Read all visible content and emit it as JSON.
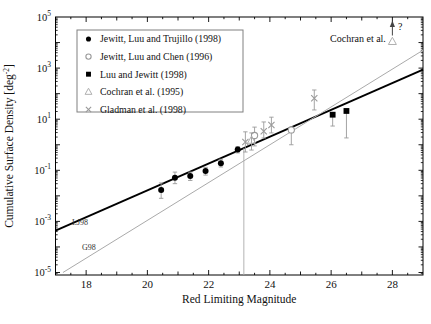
{
  "figure_title": "Cumulative surface density of Kuiper Belt objects versus red limiting magnitude",
  "colors": {
    "foreground": "#000000",
    "gray_marker": "#9a9a9a",
    "light_gray": "#b0b0b0",
    "g98_line": "#aaaaaa",
    "legend_border": "#808080",
    "background": "#ffffff"
  },
  "chart_data": {
    "type": "scatter",
    "xlabel": "Red Limiting Magnitude",
    "ylabel": "Cumulative Surface Density [deg⁻²]",
    "x_range": [
      17,
      29
    ],
    "y_exponent_range": [
      -5,
      5
    ],
    "axis_scale": {
      "x": "linear",
      "y": "log10"
    },
    "grid": false,
    "legend_position": "upper-left",
    "x_major_ticks": [
      18,
      20,
      22,
      24,
      26,
      28
    ],
    "y_labeled_exponents": [
      5,
      3,
      1,
      -1,
      -3,
      -5
    ],
    "series": [
      {
        "name": "Jewitt, Luu and Trujillo (1998)",
        "marker": "filled-circle",
        "color": "#000000",
        "points": [
          {
            "mag": 20.45,
            "density": 0.017,
            "err_lo": 0.008,
            "err_hi": 0.032
          },
          {
            "mag": 20.9,
            "density": 0.051,
            "err_lo": 0.03,
            "err_hi": 0.085
          },
          {
            "mag": 21.4,
            "density": 0.06,
            "err_lo": 0.04,
            "err_hi": 0.085
          },
          {
            "mag": 21.9,
            "density": 0.094,
            "err_lo": 0.065,
            "err_hi": 0.13
          },
          {
            "mag": 22.4,
            "density": 0.19,
            "err_lo": 0.135,
            "err_hi": 0.27
          },
          {
            "mag": 22.95,
            "density": 0.65,
            "err_lo": 0.48,
            "err_hi": 0.85
          }
        ]
      },
      {
        "name": "Jewitt, Luu and Chen (1996)",
        "marker": "open-circle",
        "color": "#9a9a9a",
        "points": [
          {
            "mag": 23.5,
            "density": 2.3,
            "err_lo": 0.9,
            "err_hi": 4.9
          },
          {
            "mag": 24.7,
            "density": 3.8,
            "err_lo": 1.0,
            "err_hi": 4.8
          }
        ]
      },
      {
        "name": "Luu and Jewitt (1998)",
        "marker": "filled-square",
        "color": "#000000",
        "points": [
          {
            "mag": 26.05,
            "density": 15,
            "err_lo": 5.4,
            "err_hi": 16.5
          },
          {
            "mag": 26.5,
            "density": 21,
            "err_lo": 1.85,
            "err_hi": 23
          }
        ]
      },
      {
        "name": "Cochran et al. (1995)",
        "marker": "open-triangle",
        "color": "#b0b0b0",
        "points": [
          {
            "mag": 23.4,
            "density": 1.5,
            "err_lo": 0.62,
            "err_hi": 2.9
          },
          {
            "mag": 28.0,
            "density": 11000,
            "err_lo": null,
            "err_hi": null,
            "annotation": "uncertain-upward-arrow"
          }
        ]
      },
      {
        "name": "Gladman et al. (1998)",
        "marker": "x",
        "color": "#9a9a9a",
        "points": [
          {
            "mag": 23.2,
            "density": 1.28,
            "err_lo": 0.52,
            "err_hi": 3.2
          },
          {
            "mag": 23.8,
            "density": 3.4,
            "err_lo": 1.84,
            "err_hi": 7.8
          },
          {
            "mag": 24.05,
            "density": 5.9,
            "err_lo": 2.9,
            "err_hi": 12
          },
          {
            "mag": 25.45,
            "density": 66,
            "err_lo": 23,
            "err_hi": 139
          }
        ]
      }
    ],
    "lines": [
      {
        "label": "LJ98",
        "slope": 0.525,
        "mag_at_unit_density": 23.4,
        "color": "#000000",
        "width": 1.9
      },
      {
        "label": "G98",
        "slope": 0.74,
        "mag_at_unit_density": 24.0,
        "color": "#aaaaaa",
        "width": 1
      }
    ],
    "vline": {
      "mag": 23.15,
      "top_density": 0.73,
      "color": "#aaaaaa"
    },
    "annotations": {
      "cochran_label": "Cochran et al.",
      "question_mark": "?"
    }
  }
}
